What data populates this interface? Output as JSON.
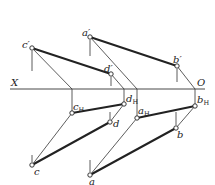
{
  "diagram": {
    "axis": {
      "left_label": "X",
      "right_label": "O",
      "y": 89,
      "x1": 10,
      "x2": 205
    },
    "labels": {
      "c_prime": "c′",
      "a_prime": "a′",
      "d_prime": "d′",
      "b_prime": "b′",
      "cH_base": "c",
      "dH_base": "d",
      "aH_base": "a",
      "bH_base": "b",
      "H_sub": "H",
      "c": "c",
      "d": "d",
      "a": "a",
      "b": "b"
    },
    "points": {
      "c_prime": [
        32,
        48
      ],
      "a_prime": [
        90,
        37
      ],
      "d_prime": [
        111,
        74
      ],
      "b_prime": [
        177,
        66
      ],
      "cH": [
        72,
        113
      ],
      "dH": [
        124,
        104
      ],
      "aH": [
        137,
        118
      ],
      "bH": [
        195,
        106
      ],
      "c": [
        32,
        165
      ],
      "d": [
        110,
        122
      ],
      "a": [
        90,
        175
      ],
      "b": [
        176,
        128
      ]
    },
    "colors": {
      "line": "#222222",
      "background": "#ffffff"
    }
  }
}
